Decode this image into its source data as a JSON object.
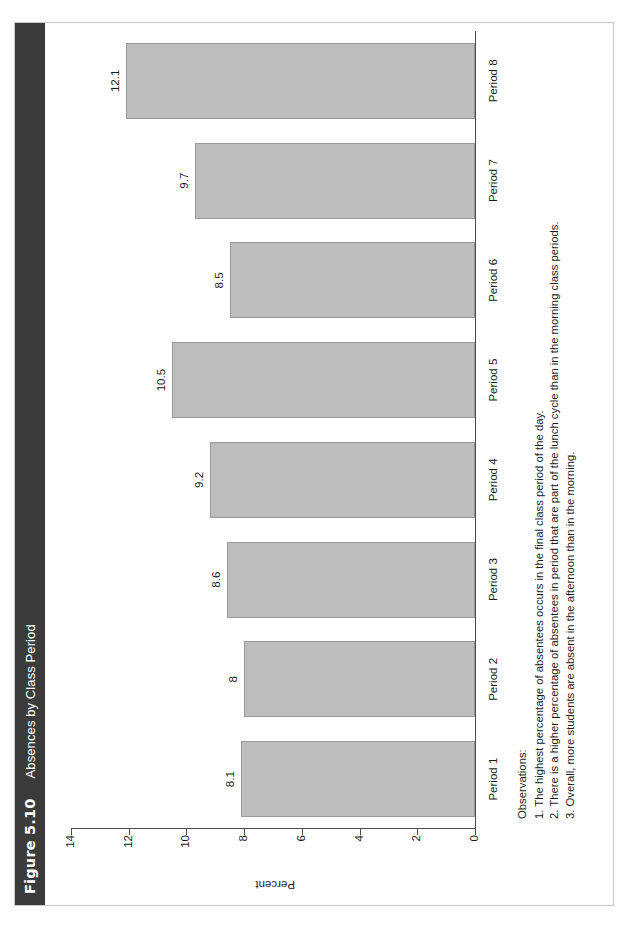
{
  "figure": {
    "number": "Figure 5.10",
    "title": "Absences by Class Period"
  },
  "chart_data": {
    "type": "bar",
    "title": "Absences by Class Period",
    "categories": [
      "Period 1",
      "Period 2",
      "Period 3",
      "Period 4",
      "Period 5",
      "Period 6",
      "Period 7",
      "Period 8"
    ],
    "values": [
      8.1,
      8,
      8.6,
      9.2,
      10.5,
      8.5,
      9.7,
      12.1
    ],
    "value_labels": [
      "8.1",
      "8",
      "8.6",
      "9.2",
      "10.5",
      "8.5",
      "9.7",
      "12.1"
    ],
    "xlabel": "",
    "ylabel": "Percent",
    "ylim": [
      0,
      14
    ],
    "yticks": [
      0,
      2,
      4,
      6,
      8,
      10,
      12,
      14
    ],
    "ytick_labels": [
      "0",
      "2",
      "4",
      "6",
      "8",
      "10",
      "12",
      "14"
    ],
    "grid": false,
    "legend": false,
    "bar_color": "#bdbdbd",
    "bar_border_color": "#9a9a9a",
    "axis_color": "#4a4a4a",
    "orientation": "vertical",
    "rotated_on_page_degrees": -90
  },
  "observations": {
    "heading": "Observations:",
    "items": [
      "1. The highest percentage of absentees occurs in the final class period of the day.",
      "2. There is a higher percentage of absentees in period that are part of the lunch cycle than in the morning class periods.",
      "3. Overall, more students are absent in the afternoon than in the morning."
    ]
  },
  "colors": {
    "title_bar_background": "#3b3b3b",
    "title_bar_text": "#ffffff",
    "page_background": "#ffffff",
    "sheet_border": "#c9c9c9"
  }
}
